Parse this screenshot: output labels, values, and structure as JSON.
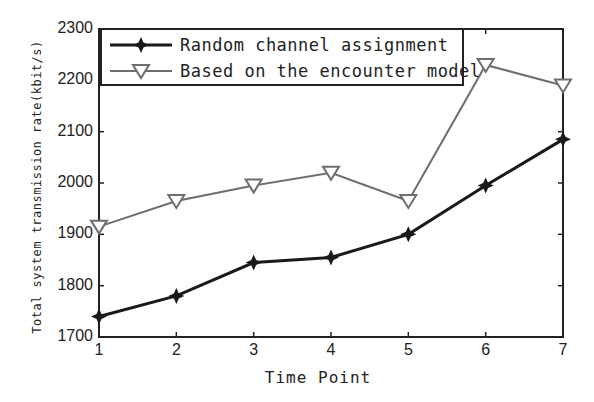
{
  "chart_data": {
    "type": "line",
    "title": "",
    "xlabel": "Time Point",
    "ylabel": "Total system transmission rate(kbit/s)",
    "x": [
      1,
      2,
      3,
      4,
      5,
      6,
      7
    ],
    "xticks": [
      "1",
      "2",
      "3",
      "4",
      "5",
      "6",
      "7"
    ],
    "yticks": [
      "1700",
      "1800",
      "1900",
      "2000",
      "2100",
      "2200",
      "2300"
    ],
    "xlim": [
      1,
      7
    ],
    "ylim": [
      1700,
      2300
    ],
    "grid": false,
    "legend_position": "upper left",
    "series": [
      {
        "name": "Random channel assignment",
        "marker": "star-filled",
        "color": "#1a1a1a",
        "values": [
          1740,
          1780,
          1845,
          1855,
          1900,
          1995,
          2085
        ]
      },
      {
        "name": "Based on the encounter model",
        "marker": "triangle-down-open",
        "color": "#6e6e6e",
        "values": [
          1915,
          1965,
          1995,
          2020,
          1965,
          2230,
          2190
        ]
      }
    ]
  }
}
